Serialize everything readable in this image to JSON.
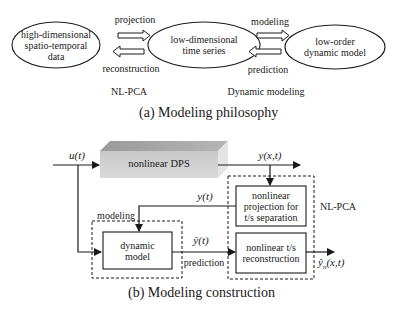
{
  "part_a": {
    "caption": "(a) Modeling philosophy",
    "nodes": {
      "high_dim": [
        "high-dimensional",
        "spatio-temporal",
        "data"
      ],
      "low_dim": [
        "low-dimensional",
        "time series"
      ],
      "low_order": [
        "low-order",
        "dynamic model"
      ]
    },
    "arrows": {
      "projection": "projection",
      "reconstruction": "reconstruction",
      "modeling": "modeling",
      "prediction": "prediction"
    },
    "groups": {
      "nlpca": "NL-PCA",
      "dynamic_modeling": "Dynamic modeling"
    }
  },
  "part_b": {
    "caption": "(b) Modeling construction",
    "dps": "nonlinear DPS",
    "input": "u(t)",
    "output": "y(x,t)",
    "yt": "y(t)",
    "yhat_t": "ŷ(t)",
    "yhat_n": "ŷ",
    "yhat_n_sub": "n",
    "yhat_n_args": "(x,t)",
    "modeling": "modeling",
    "prediction": "prediction",
    "nlpca": "NL-PCA",
    "dynamic_model": [
      "dynamic",
      "model"
    ],
    "projection_box": [
      "nonlinear",
      "projection for",
      "t/s separation"
    ],
    "reconstruction_box": [
      "nonlinear t/s",
      "reconstruction"
    ]
  }
}
